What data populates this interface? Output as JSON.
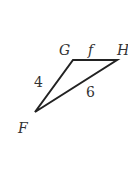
{
  "diagram": {
    "type": "triangle",
    "vertices": {
      "G": {
        "label": "G",
        "x": 73,
        "y": 60
      },
      "H": {
        "label": "H",
        "x": 117,
        "y": 60
      },
      "F": {
        "label": "F",
        "x": 35,
        "y": 112
      }
    },
    "sides": {
      "GH": {
        "label": "f"
      },
      "FG": {
        "label": "4"
      },
      "FH": {
        "label": "6"
      }
    },
    "stroke_color": "#222222",
    "text_color": "#333333"
  }
}
